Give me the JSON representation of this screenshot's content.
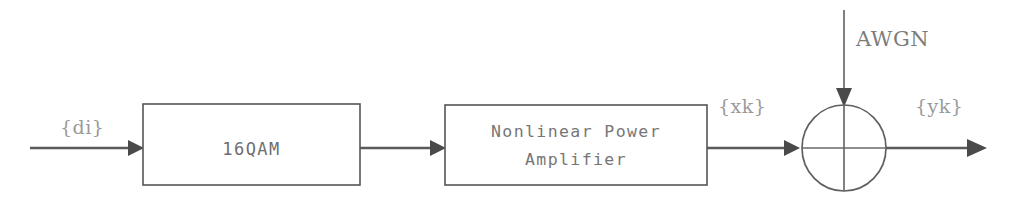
{
  "diagram": {
    "background_color": "#ffffff",
    "line_color": "#5a5a5a",
    "text_color": "#6e6e6e",
    "blocks": [
      {
        "id": "modulator",
        "label": "16QAM",
        "lines": [
          "16QAM"
        ],
        "x": 143,
        "y": 104,
        "width": 217,
        "height": 81
      },
      {
        "id": "amplifier",
        "label": "Nonlinear Power Amplifier",
        "lines": [
          "Nonlinear Power",
          "Amplifier"
        ],
        "x": 445,
        "y": 105,
        "width": 262,
        "height": 80
      }
    ],
    "summing_node": {
      "id": "adder",
      "label": "summing-junction",
      "cx": 844,
      "cy": 148,
      "rx": 42,
      "ry": 43
    },
    "signals": {
      "input": "{di}",
      "amplifier_output": "{xk}",
      "channel_output": "{yk}",
      "noise": "AWGN"
    },
    "connections": [
      {
        "id": "in-to-modulator",
        "from": "input",
        "to": "modulator"
      },
      {
        "id": "modulator-to-amplifier",
        "from": "modulator",
        "to": "amplifier"
      },
      {
        "id": "amplifier-to-adder",
        "from": "amplifier",
        "to": "adder"
      },
      {
        "id": "noise-to-adder",
        "from": "AWGN",
        "to": "adder"
      },
      {
        "id": "adder-to-out",
        "from": "adder",
        "to": "output"
      }
    ]
  }
}
